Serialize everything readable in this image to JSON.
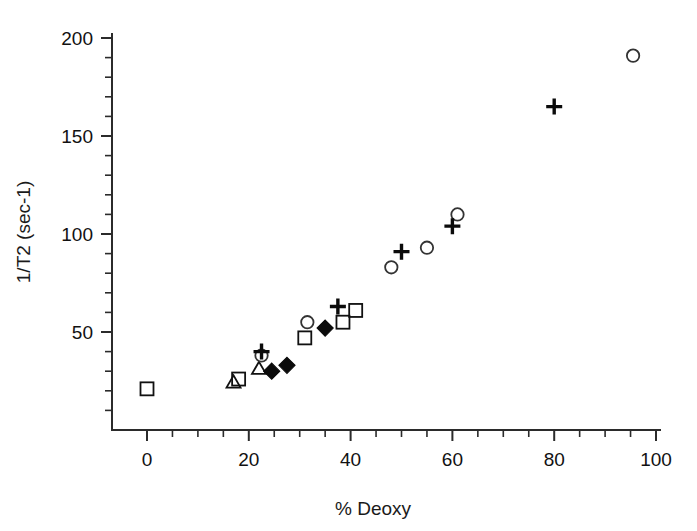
{
  "chart_data": {
    "type": "scatter",
    "title": "",
    "xlabel": "% Deoxy",
    "ylabel": "1/T2 (sec-1)",
    "xlim": [
      0,
      100
    ],
    "ylim": [
      0,
      200
    ],
    "xticks": [
      0,
      20,
      40,
      60,
      80,
      100
    ],
    "yticks": [
      50,
      100,
      150,
      200
    ],
    "xtick_labels": [
      "0",
      "20",
      "40",
      "60",
      "80",
      "100"
    ],
    "ytick_labels": [
      "50",
      "100",
      "150",
      "200"
    ],
    "x_minor_step": 5,
    "y_minor_step": 10,
    "grid": false,
    "legend": "none",
    "series": [
      {
        "name": "open-square",
        "marker": "open-square",
        "points": [
          {
            "x": 0.0,
            "y": 21
          },
          {
            "x": 18.0,
            "y": 26
          },
          {
            "x": 31.0,
            "y": 47
          },
          {
            "x": 38.5,
            "y": 55
          },
          {
            "x": 41.0,
            "y": 61
          }
        ]
      },
      {
        "name": "open-triangle",
        "marker": "open-triangle",
        "points": [
          {
            "x": 17.0,
            "y": 24
          },
          {
            "x": 22.0,
            "y": 31
          }
        ]
      },
      {
        "name": "filled-diamond",
        "marker": "filled-diamond",
        "points": [
          {
            "x": 24.5,
            "y": 30
          },
          {
            "x": 27.5,
            "y": 33
          },
          {
            "x": 35.0,
            "y": 52
          }
        ]
      },
      {
        "name": "open-circle",
        "marker": "open-circle",
        "points": [
          {
            "x": 22.5,
            "y": 38
          },
          {
            "x": 31.5,
            "y": 55
          },
          {
            "x": 48.0,
            "y": 83
          },
          {
            "x": 55.0,
            "y": 93
          },
          {
            "x": 61.0,
            "y": 110
          },
          {
            "x": 95.5,
            "y": 191
          }
        ]
      },
      {
        "name": "plus",
        "marker": "plus",
        "points": [
          {
            "x": 22.5,
            "y": 40
          },
          {
            "x": 37.5,
            "y": 63
          },
          {
            "x": 50.0,
            "y": 91
          },
          {
            "x": 60.0,
            "y": 104
          },
          {
            "x": 80.0,
            "y": 165
          }
        ]
      }
    ]
  },
  "axes": {
    "x_axis_name": "% Deoxy",
    "y_axis_name": "1/T2 (sec-1)"
  }
}
